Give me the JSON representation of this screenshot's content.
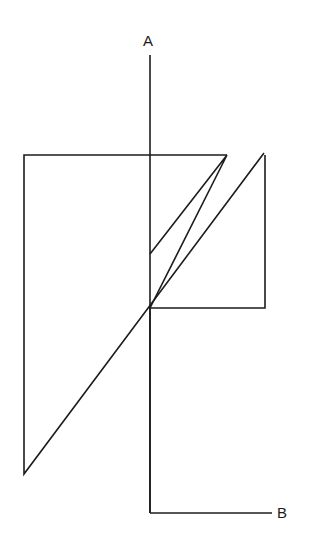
{
  "figure": {
    "background_color": "#ffffff",
    "stroke_color": "#1c1c1c",
    "stroke_width": 1.6,
    "canvas": {
      "width": 315,
      "height": 554
    }
  },
  "labels": {
    "axis_a": "A",
    "axis_b": "B"
  },
  "axes": {
    "a": {
      "name": "A",
      "orientation": "vertical",
      "x": 150,
      "y_start": 55,
      "y_end": 513,
      "label_x": 148,
      "label_y": 46
    },
    "b": {
      "name": "B",
      "orientation": "horizontal",
      "y": 513,
      "x_start": 150,
      "x_end": 272,
      "label_x": 277,
      "label_y": 518
    }
  },
  "shapes": [
    {
      "name": "left-polygon",
      "type": "polyline",
      "closed": false,
      "points": "227,155 24,155 24,474 264,153"
    },
    {
      "name": "right-polygon",
      "type": "polyline",
      "closed": false,
      "points": "150,254 227,155 150,308 265,308 265,155"
    }
  ],
  "vertices": [
    {
      "name": "top-left-corner",
      "x": 24,
      "y": 155
    },
    {
      "name": "bottom-left-vertex",
      "x": 25,
      "y": 474
    },
    {
      "name": "top-mid-corner",
      "x": 227,
      "y": 155
    },
    {
      "name": "apex-right",
      "x": 264,
      "y": 153
    },
    {
      "name": "v-notch-vertex",
      "x": 150,
      "y": 254
    },
    {
      "name": "center-junction",
      "x": 150,
      "y": 308
    },
    {
      "name": "right-lower-corner",
      "x": 265,
      "y": 308
    },
    {
      "name": "axis-corner",
      "x": 150,
      "y": 513
    }
  ]
}
